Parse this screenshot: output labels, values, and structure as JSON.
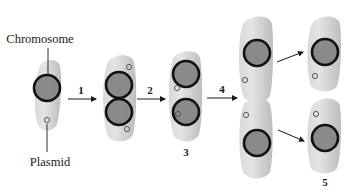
{
  "diagram": {
    "type": "bacterial-cell-division-plasmid-segregation",
    "labels": {
      "chromosome": "Chromosome",
      "plasmid": "Plasmid"
    },
    "steps": [
      {
        "id": "1",
        "label": "1"
      },
      {
        "id": "2",
        "label": "2"
      },
      {
        "id": "3",
        "label": "3"
      },
      {
        "id": "4",
        "label": "4"
      },
      {
        "id": "5",
        "label": "5"
      }
    ],
    "colors": {
      "cell_fill": "#c9c9c9",
      "cell_highlight": "#e6e6e6",
      "chromosome_fill": "#8a8a8a",
      "chromosome_stroke": "#111111",
      "plasmid_stroke": "#555555",
      "arrow": "#1a1a1a"
    }
  }
}
